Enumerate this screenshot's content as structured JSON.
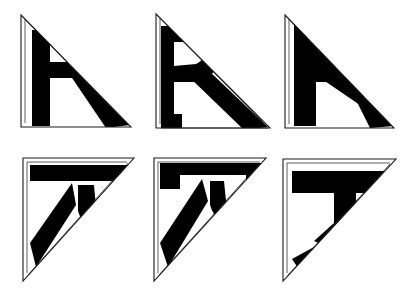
{
  "figure": {
    "title": "",
    "caption": "",
    "background_color": "#ffffff",
    "ink_color": "#000000",
    "outline_color": "#1a1a1a",
    "width": 410,
    "height": 291,
    "grid": {
      "rows": 2,
      "cols": 3
    }
  },
  "panels": [
    {
      "id": "panel-r-upright-original",
      "row": 0,
      "col": 0,
      "glyph": "R",
      "orientation": "upright",
      "right_angle_corner": "bottom-left",
      "deformation": "none",
      "x": 18,
      "y": 12,
      "w": 118,
      "h": 120
    },
    {
      "id": "panel-r-upright-compressed",
      "row": 0,
      "col": 1,
      "glyph": "R",
      "orientation": "upright",
      "right_angle_corner": "bottom-left",
      "deformation": "horizontal-compression",
      "x": 152,
      "y": 10,
      "w": 124,
      "h": 122
    },
    {
      "id": "panel-r-upright-collapsed",
      "row": 0,
      "col": 2,
      "glyph": "R",
      "orientation": "upright",
      "right_angle_corner": "bottom-left",
      "deformation": "bowl-collapsed",
      "x": 280,
      "y": 10,
      "w": 118,
      "h": 122
    },
    {
      "id": "panel-r-rotated-original",
      "row": 1,
      "col": 0,
      "glyph": "R",
      "orientation": "rotated-90",
      "right_angle_corner": "top-left",
      "deformation": "none",
      "x": 20,
      "y": 155,
      "w": 118,
      "h": 128
    },
    {
      "id": "panel-r-rotated-compressed",
      "row": 1,
      "col": 1,
      "glyph": "R",
      "orientation": "rotated-90",
      "right_angle_corner": "top-left",
      "deformation": "vertical-compression",
      "x": 150,
      "y": 155,
      "w": 120,
      "h": 128
    },
    {
      "id": "panel-r-rotated-collapsed",
      "row": 1,
      "col": 2,
      "glyph": "R",
      "orientation": "rotated-90",
      "right_angle_corner": "top-left",
      "deformation": "bowl-collapsed",
      "x": 278,
      "y": 155,
      "w": 122,
      "h": 128
    }
  ]
}
